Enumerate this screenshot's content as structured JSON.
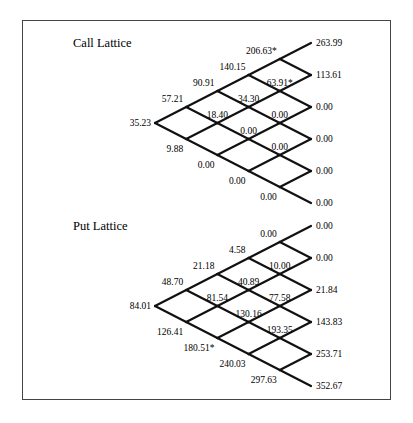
{
  "lattices": [
    {
      "title": "Call Lattice",
      "root": [
        155,
        123
      ],
      "title_pos": [
        73,
        47
      ],
      "nodes": [
        [
          "35.23"
        ],
        [
          "9.88",
          "57.21"
        ],
        [
          "0.00",
          "18.40",
          "90.91"
        ],
        [
          "0.00",
          "0.00",
          "34.30",
          "140.15"
        ],
        [
          "0.00",
          "0.00",
          "0.00",
          "63.91*",
          "206.63*"
        ],
        [
          "0.00",
          "0.00",
          "0.00",
          "0.00",
          "113.61",
          "263.99"
        ]
      ]
    },
    {
      "title": "Put Lattice",
      "root": [
        155,
        306
      ],
      "title_pos": [
        73,
        230
      ],
      "nodes": [
        [
          "84.01"
        ],
        [
          "126.41",
          "48.70"
        ],
        [
          "180.51*",
          "81.54",
          "21.18"
        ],
        [
          "240.03",
          "130.16",
          "40.89",
          "4.58"
        ],
        [
          "297.63",
          "193.35",
          "77.58",
          "10.00",
          "0.00"
        ],
        [
          "352.67",
          "253.71",
          "143.83",
          "21.84",
          "0.00",
          "0.00"
        ]
      ]
    }
  ],
  "geometry": {
    "dx": 31.2,
    "dy": 16
  }
}
